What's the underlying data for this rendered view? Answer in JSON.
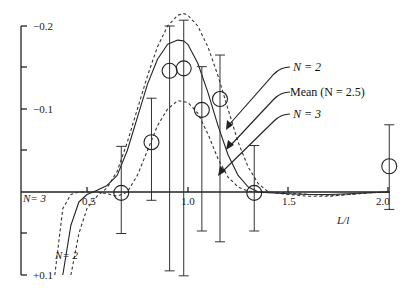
{
  "chart_data": {
    "type": "line",
    "title": "",
    "xlabel": "L/l",
    "ylabel": "",
    "xlim": [
      0.32,
      2.02
    ],
    "ylim": [
      0.1,
      -0.2
    ],
    "y_inverted": true,
    "x_ticks": [
      0.5,
      1.0,
      1.5,
      2.0
    ],
    "x_tick_labels": [
      "0.5",
      "1.0",
      "1.5",
      "2.0"
    ],
    "y_ticks": [
      -0.2,
      -0.15,
      -0.1,
      -0.05,
      0,
      0.05,
      0.1
    ],
    "y_tick_labels": [
      "−0.2",
      "",
      "−0.1",
      "",
      "",
      "",
      "+0.1"
    ],
    "grid": false,
    "series": [
      {
        "name": "N = 2",
        "style": "dashed",
        "x": [
          0.42,
          0.46,
          0.5,
          0.55,
          0.6,
          0.65,
          0.7,
          0.75,
          0.8,
          0.85,
          0.9,
          0.95,
          0.98,
          1.0,
          1.05,
          1.1,
          1.15,
          1.2,
          1.25,
          1.3,
          1.35,
          1.4,
          1.5,
          1.6,
          1.7,
          1.8,
          1.9,
          2.0
        ],
        "y": [
          0.1,
          0.05,
          0.02,
          0.005,
          -0.005,
          -0.025,
          -0.06,
          -0.1,
          -0.14,
          -0.175,
          -0.2,
          -0.213,
          -0.215,
          -0.213,
          -0.2,
          -0.175,
          -0.14,
          -0.1,
          -0.06,
          -0.03,
          -0.01,
          0.0,
          0.003,
          0.005,
          0.005,
          0.003,
          0.001,
          0.0
        ]
      },
      {
        "name": "Mean (N = 2.5)",
        "style": "solid",
        "x": [
          0.38,
          0.42,
          0.46,
          0.5,
          0.55,
          0.6,
          0.65,
          0.7,
          0.75,
          0.8,
          0.85,
          0.9,
          0.95,
          0.98,
          1.0,
          1.05,
          1.1,
          1.15,
          1.2,
          1.25,
          1.3,
          1.35,
          1.4,
          1.5,
          1.6,
          1.7,
          1.8,
          1.9,
          2.0
        ],
        "y": [
          0.1,
          0.04,
          0.012,
          0.003,
          -0.002,
          -0.008,
          -0.02,
          -0.05,
          -0.09,
          -0.13,
          -0.16,
          -0.178,
          -0.183,
          -0.182,
          -0.178,
          -0.155,
          -0.12,
          -0.08,
          -0.045,
          -0.02,
          -0.006,
          0.0,
          0.001,
          0.002,
          0.003,
          0.003,
          0.002,
          0.001,
          0.0
        ]
      },
      {
        "name": "N = 3",
        "style": "dashed",
        "x": [
          0.34,
          0.38,
          0.42,
          0.46,
          0.5,
          0.55,
          0.6,
          0.65,
          0.7,
          0.75,
          0.8,
          0.85,
          0.9,
          0.95,
          1.0,
          1.05,
          1.1,
          1.15,
          1.2,
          1.25,
          1.3,
          1.35,
          1.4,
          1.5,
          1.6,
          1.7,
          1.8,
          1.9,
          2.0
        ],
        "y": [
          0.1,
          0.02,
          0.003,
          0.0,
          0.0,
          0.0,
          0.002,
          0.005,
          0.0,
          -0.02,
          -0.05,
          -0.08,
          -0.1,
          -0.11,
          -0.108,
          -0.095,
          -0.07,
          -0.04,
          -0.018,
          -0.006,
          -0.001,
          0.0,
          0.0,
          0.001,
          0.003,
          0.004,
          0.003,
          0.001,
          0.0
        ]
      },
      {
        "name": "Data points",
        "style": "marker-circle",
        "x": [
          0.67,
          0.82,
          0.91,
          0.98,
          1.07,
          1.16,
          1.33,
          2.0
        ],
        "y": [
          0.001,
          -0.06,
          -0.146,
          -0.149,
          -0.099,
          -0.112,
          0.001,
          -0.031
        ],
        "err_low": [
          0.05,
          0.01,
          0.095,
          0.101,
          0.047,
          0.06,
          0.047,
          0.021
        ],
        "err_high": [
          -0.055,
          -0.113,
          -0.2,
          -0.207,
          -0.151,
          -0.165,
          -0.056,
          -0.081
        ]
      }
    ],
    "annotations": [
      {
        "text": "N = 2",
        "target": "N = 2 curve",
        "arrow": true
      },
      {
        "text": "Mean (N = 2.5)",
        "target": "Mean curve",
        "arrow": true
      },
      {
        "text": "N = 3",
        "target": "N = 3 curve",
        "arrow": true
      },
      {
        "text": "N= 3",
        "position": "lower left near axis"
      },
      {
        "text": "N= 2",
        "position": "lower left near N=2 curve"
      }
    ],
    "legend_position": "right, via arrow annotations"
  },
  "labels": {
    "xlabel": "L/l",
    "y_top": "−0.2",
    "y_mid": "−0.1",
    "y_bottom": "+0.1",
    "x05": "0.5",
    "x10": "1.0",
    "x15": "1.5",
    "x20": "2.0",
    "ann_n2": "N = 2",
    "ann_mean": "Mean (N = 2.5)",
    "ann_n3": "N = 3",
    "low_n3": "N= 3",
    "low_n2": "N= 2"
  }
}
